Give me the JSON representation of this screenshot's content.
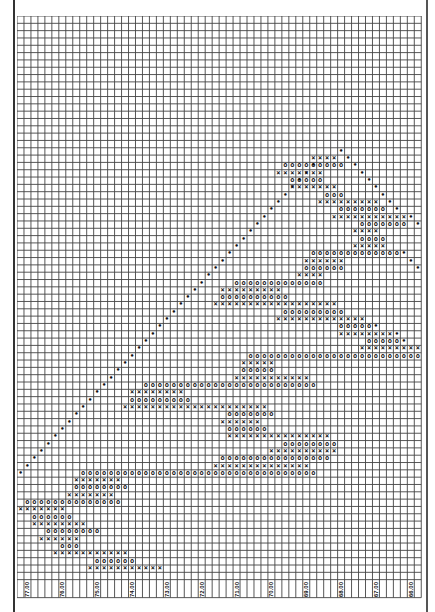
{
  "chart_data": {
    "type": "point-and-figure",
    "title": "",
    "xlabel": "Price",
    "ylabel": "",
    "orientation": "price axis horizontal (labels rotated along bottom), columns stacked vertically",
    "grid": {
      "columns": 58,
      "rows": 77,
      "box_size": 0.2,
      "cell_w": 6.97,
      "cell_h": 7.32
    },
    "tick_labels": [
      "77.00",
      "76.00",
      "75.00",
      "74.00",
      "73.00",
      "72.00",
      "71.00",
      "70.00",
      "69.00",
      "68.00",
      "67.00",
      "66.00"
    ],
    "tick_columns": [
      1,
      6,
      11,
      16,
      21,
      26,
      31,
      36,
      41,
      46,
      51,
      56
    ],
    "price_range": [
      77.2,
      65.8
    ],
    "legend": {
      "X": "rising column",
      "O": "falling column",
      "•": "trend line"
    },
    "runs": [
      {
        "row": 19,
        "from": 42,
        "to": 45,
        "sym": "X"
      },
      {
        "row": 20,
        "from": 38,
        "to": 46,
        "sym": "O"
      },
      {
        "row": 21,
        "from": 37,
        "to": 43,
        "sym": "X"
      },
      {
        "row": 22,
        "from": 39,
        "to": 43,
        "sym": "O"
      },
      {
        "row": 23,
        "from": 39,
        "to": 45,
        "sym": "X"
      },
      {
        "row": 24,
        "from": 44,
        "to": 46,
        "sym": "O"
      },
      {
        "row": 25,
        "from": 43,
        "to": 51,
        "sym": "X"
      },
      {
        "row": 26,
        "from": 46,
        "to": 52,
        "sym": "O"
      },
      {
        "row": 27,
        "from": 45,
        "to": 55,
        "sym": "X"
      },
      {
        "row": 28,
        "from": 49,
        "to": 55,
        "sym": "O"
      },
      {
        "row": 29,
        "from": 48,
        "to": 51,
        "sym": "X"
      },
      {
        "row": 30,
        "from": 49,
        "to": 52,
        "sym": "O"
      },
      {
        "row": 31,
        "from": 48,
        "to": 52,
        "sym": "X"
      },
      {
        "row": 32,
        "from": 42,
        "to": 54,
        "sym": "O"
      },
      {
        "row": 33,
        "from": 41,
        "to": 46,
        "sym": "X"
      },
      {
        "row": 34,
        "from": 41,
        "to": 46,
        "sym": "O"
      },
      {
        "row": 35,
        "from": 40,
        "to": 43,
        "sym": "X"
      },
      {
        "row": 36,
        "from": 31,
        "to": 43,
        "sym": "O"
      },
      {
        "row": 37,
        "from": 29,
        "to": 37,
        "sym": "X"
      },
      {
        "row": 38,
        "from": 29,
        "to": 38,
        "sym": "O"
      },
      {
        "row": 39,
        "from": 28,
        "to": 45,
        "sym": "X"
      },
      {
        "row": 40,
        "from": 38,
        "to": 46,
        "sym": "O"
      },
      {
        "row": 41,
        "from": 37,
        "to": 49,
        "sym": "X"
      },
      {
        "row": 42,
        "from": 46,
        "to": 50,
        "sym": "O"
      },
      {
        "row": 43,
        "from": 46,
        "to": 53,
        "sym": "X"
      },
      {
        "row": 44,
        "from": 50,
        "to": 54,
        "sym": "O"
      },
      {
        "row": 45,
        "from": 49,
        "to": 57,
        "sym": "X"
      },
      {
        "row": 46,
        "from": 33,
        "to": 57,
        "sym": "O"
      },
      {
        "row": 47,
        "from": 32,
        "to": 36,
        "sym": "X"
      },
      {
        "row": 48,
        "from": 32,
        "to": 36,
        "sym": "O"
      },
      {
        "row": 49,
        "from": 31,
        "to": 41,
        "sym": "X"
      },
      {
        "row": 50,
        "from": 18,
        "to": 42,
        "sym": "O"
      },
      {
        "row": 51,
        "from": 16,
        "to": 23,
        "sym": "X"
      },
      {
        "row": 52,
        "from": 16,
        "to": 24,
        "sym": "O"
      },
      {
        "row": 53,
        "from": 15,
        "to": 35,
        "sym": "X"
      },
      {
        "row": 54,
        "from": 30,
        "to": 36,
        "sym": "O"
      },
      {
        "row": 55,
        "from": 29,
        "to": 34,
        "sym": "X"
      },
      {
        "row": 56,
        "from": 30,
        "to": 35,
        "sym": "O"
      },
      {
        "row": 57,
        "from": 30,
        "to": 44,
        "sym": "X"
      },
      {
        "row": 58,
        "from": 38,
        "to": 45,
        "sym": "O"
      },
      {
        "row": 59,
        "from": 36,
        "to": 45,
        "sym": "X"
      },
      {
        "row": 60,
        "from": 29,
        "to": 44,
        "sym": "O"
      },
      {
        "row": 61,
        "from": 28,
        "to": 41,
        "sym": "X"
      },
      {
        "row": 62,
        "from": 9,
        "to": 42,
        "sym": "O"
      },
      {
        "row": 63,
        "from": 8,
        "to": 14,
        "sym": "X"
      },
      {
        "row": 64,
        "from": 8,
        "to": 15,
        "sym": "O"
      },
      {
        "row": 65,
        "from": 7,
        "to": 13,
        "sym": "X"
      },
      {
        "row": 66,
        "from": 1,
        "to": 14,
        "sym": "O"
      },
      {
        "row": 67,
        "from": 0,
        "to": 6,
        "sym": "X"
      },
      {
        "row": 68,
        "from": 2,
        "to": 7,
        "sym": "O"
      },
      {
        "row": 69,
        "from": 2,
        "to": 9,
        "sym": "X"
      },
      {
        "row": 70,
        "from": 4,
        "to": 11,
        "sym": "O"
      },
      {
        "row": 71,
        "from": 3,
        "to": 8,
        "sym": "X"
      },
      {
        "row": 72,
        "from": 6,
        "to": 8,
        "sym": "O"
      },
      {
        "row": 73,
        "from": 5,
        "to": 15,
        "sym": "X"
      },
      {
        "row": 74,
        "from": 11,
        "to": 16,
        "sym": "O"
      },
      {
        "row": 75,
        "from": 10,
        "to": 20,
        "sym": "X"
      }
    ],
    "trend_dots": [
      [
        18,
        46
      ],
      [
        19,
        47
      ],
      [
        20,
        48
      ],
      [
        21,
        49
      ],
      [
        22,
        50
      ],
      [
        23,
        51
      ],
      [
        24,
        52
      ],
      [
        25,
        53
      ],
      [
        26,
        54
      ],
      [
        27,
        56
      ],
      [
        28,
        57
      ],
      [
        20,
        42
      ],
      [
        21,
        41
      ],
      [
        22,
        40
      ],
      [
        23,
        39
      ],
      [
        24,
        38
      ],
      [
        25,
        37
      ],
      [
        26,
        36
      ],
      [
        27,
        35
      ],
      [
        28,
        34
      ],
      [
        29,
        33
      ],
      [
        30,
        32
      ],
      [
        31,
        31
      ],
      [
        32,
        30
      ],
      [
        33,
        29
      ],
      [
        34,
        28
      ],
      [
        35,
        27
      ],
      [
        36,
        26
      ],
      [
        37,
        25
      ],
      [
        38,
        24
      ],
      [
        39,
        23
      ],
      [
        40,
        22
      ],
      [
        41,
        21
      ],
      [
        42,
        20
      ],
      [
        43,
        19
      ],
      [
        44,
        18
      ],
      [
        45,
        17
      ],
      [
        46,
        16
      ],
      [
        47,
        15
      ],
      [
        48,
        14
      ],
      [
        49,
        13
      ],
      [
        50,
        12
      ],
      [
        51,
        11
      ],
      [
        52,
        10
      ],
      [
        53,
        9
      ],
      [
        54,
        8
      ],
      [
        55,
        7
      ],
      [
        56,
        6
      ],
      [
        57,
        5
      ],
      [
        58,
        4
      ],
      [
        59,
        3
      ],
      [
        60,
        2
      ],
      [
        61,
        1
      ],
      [
        62,
        0
      ],
      [
        32,
        55
      ],
      [
        33,
        56
      ],
      [
        34,
        57
      ],
      [
        42,
        51
      ],
      [
        43,
        54
      ],
      [
        44,
        55
      ],
      [
        45,
        58
      ]
    ]
  }
}
